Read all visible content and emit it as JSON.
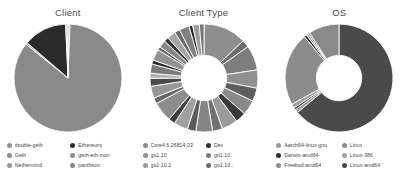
{
  "chart_data": [
    {
      "type": "pie",
      "title": "Client",
      "xlabel": "",
      "ylabel": "",
      "legend_position": "bottom",
      "hole": 0.0,
      "categories": [
        "double-geth",
        "Geth",
        "Nethermind",
        "Ethereumj",
        "geth-eth-mon",
        "pantheon"
      ],
      "values": [
        0.6,
        85.2,
        0.5,
        13.0,
        0.4,
        0.3
      ],
      "colors": [
        "#8f8f8f",
        "#8a8a8a",
        "#949494",
        "#2b2b2b",
        "#9a9a9a",
        "#868686"
      ],
      "legend": [
        {
          "label": "double-geth",
          "color": "#8f8f8f"
        },
        {
          "label": "Geth",
          "color": "#8a8a8a"
        },
        {
          "label": "Nethermind",
          "color": "#949494"
        },
        {
          "label": "Ethereumj",
          "color": "#2b2b2b"
        },
        {
          "label": "geth-eth-mon",
          "color": "#8d8d8d"
        },
        {
          "label": "pantheon",
          "color": "#878787"
        }
      ]
    },
    {
      "type": "pie",
      "title": "Client Type",
      "xlabel": "",
      "ylabel": "",
      "legend_position": "bottom",
      "hole": 0.42,
      "categories": [
        "Core4.6.26814.03",
        "go1.10",
        "go1.10.2",
        "Dev",
        "go1.10.",
        "go1.10.:"
      ],
      "values": [
        9.5,
        8.0,
        6.5,
        10.5,
        7.5,
        9.0
      ],
      "colors": [
        "#8a8a8a",
        "#6e6e6e",
        "#a3a3a3",
        "#2f2f2f",
        "#7b7b7b",
        "#555555"
      ],
      "legend": [
        {
          "label": "Core4.6.26814.03",
          "color": "#8a8a8a"
        },
        {
          "label": "go1.10",
          "color": "#8f8f8f"
        },
        {
          "label": "go1.10.2",
          "color": "#999999"
        },
        {
          "label": "Dev",
          "color": "#2f2f2f"
        },
        {
          "label": "go1.10.",
          "color": "#7b7b7b"
        },
        {
          "label": "go1.10.:",
          "color": "#6a6a6a"
        }
      ],
      "segments": [
        {
          "value": 13.0,
          "color": "#8e8e8e"
        },
        {
          "value": 2.2,
          "color": "#6d6d6d"
        },
        {
          "value": 7.5,
          "color": "#7d7d7d"
        },
        {
          "value": 5.5,
          "color": "#909090"
        },
        {
          "value": 4.0,
          "color": "#5e5e5e"
        },
        {
          "value": 4.5,
          "color": "#8a8a8a"
        },
        {
          "value": 3.2,
          "color": "#3a3a3a"
        },
        {
          "value": 4.8,
          "color": "#9b9b9b"
        },
        {
          "value": 3.0,
          "color": "#717171"
        },
        {
          "value": 5.0,
          "color": "#848484"
        },
        {
          "value": 2.6,
          "color": "#5a5a5a"
        },
        {
          "value": 4.2,
          "color": "#a0a0a0"
        },
        {
          "value": 2.0,
          "color": "#3f3f3f"
        },
        {
          "value": 6.0,
          "color": "#8c8c8c"
        },
        {
          "value": 1.8,
          "color": "#666666"
        },
        {
          "value": 3.6,
          "color": "#979797"
        },
        {
          "value": 2.4,
          "color": "#4a4a4a"
        },
        {
          "value": 1.5,
          "color": "#b0b0b0"
        },
        {
          "value": 2.8,
          "color": "#7a7a7a"
        },
        {
          "value": 1.2,
          "color": "#2d2d2d"
        },
        {
          "value": 3.4,
          "color": "#929292"
        },
        {
          "value": 1.0,
          "color": "#5f5f5f"
        },
        {
          "value": 2.2,
          "color": "#888888"
        },
        {
          "value": 1.4,
          "color": "#343434"
        },
        {
          "value": 2.6,
          "color": "#a6a6a6"
        },
        {
          "value": 1.6,
          "color": "#6b6b6b"
        },
        {
          "value": 3.0,
          "color": "#808080"
        },
        {
          "value": 1.1,
          "color": "#272727"
        },
        {
          "value": 2.0,
          "color": "#9e9e9e"
        },
        {
          "value": 1.4,
          "color": "#747474"
        }
      ]
    },
    {
      "type": "pie",
      "title": "OS",
      "xlabel": "",
      "ylabel": "",
      "legend_position": "bottom",
      "hole": 0.42,
      "categories": [
        "Aarch64-linux-gnu",
        "Darwin-amd64",
        "Freebsd-amd64",
        "Linux",
        "Linux-386",
        "Linux-amd64"
      ],
      "values": [
        0.5,
        0.8,
        0.4,
        1.2,
        0.6,
        96.5
      ],
      "colors": [
        "#9a9a9a",
        "#2c2c2c",
        "#8e8e8e",
        "#8a8a8a",
        "#a2a2a2",
        "#4a4a4a"
      ],
      "legend": [
        {
          "label": "Aarch64-linux-gnu",
          "color": "#9a9a9a"
        },
        {
          "label": "Darwin-amd64",
          "color": "#2c2c2c"
        },
        {
          "label": "Freebsd-amd64",
          "color": "#8e8e8e"
        },
        {
          "label": "Linux",
          "color": "#8a8a8a"
        },
        {
          "label": "Linux-386",
          "color": "#a2a2a2"
        },
        {
          "label": "Linux-amd64",
          "color": "#4a4a4a"
        }
      ],
      "segments": [
        {
          "value": 64.0,
          "color": "#4a4a4a"
        },
        {
          "value": 1.0,
          "color": "#8f8f8f"
        },
        {
          "value": 0.7,
          "color": "#3a3a3a"
        },
        {
          "value": 1.2,
          "color": "#9d9d9d"
        },
        {
          "value": 22.0,
          "color": "#8c8c8c"
        },
        {
          "value": 0.8,
          "color": "#2e2e2e"
        },
        {
          "value": 0.6,
          "color": "#a5a5a5"
        },
        {
          "value": 0.5,
          "color": "#6a6a6a"
        },
        {
          "value": 9.2,
          "color": "#8a8a8a"
        }
      ]
    }
  ]
}
